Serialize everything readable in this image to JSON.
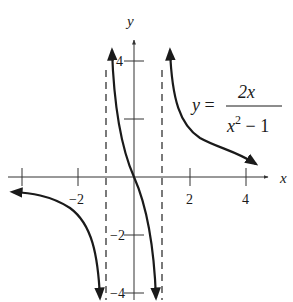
{
  "figure": {
    "type": "function-graph",
    "function": "y = 2x / (x^2 - 1)",
    "equation": {
      "lhs": "y =",
      "numerator": "2x",
      "denominator_base": "x",
      "denominator_exp": "2",
      "denominator_rest": " − 1"
    },
    "axes": {
      "x_label": "x",
      "y_label": "y",
      "x_ticks": [
        {
          "value": -4,
          "label": ""
        },
        {
          "value": -2,
          "label": "−2"
        },
        {
          "value": 2,
          "label": "2"
        },
        {
          "value": 4,
          "label": "4"
        }
      ],
      "y_ticks": [
        {
          "value": 4,
          "label": "4"
        },
        {
          "value": 2,
          "label": ""
        },
        {
          "value": -2,
          "label": "−2"
        },
        {
          "value": -4,
          "label": "−4"
        }
      ]
    },
    "asymptotes": [
      {
        "type": "vertical",
        "x": -1,
        "style": "dashed"
      },
      {
        "type": "vertical",
        "x": 1,
        "style": "dashed"
      },
      {
        "type": "horizontal",
        "y": 0
      }
    ],
    "colors": {
      "curve": "#1a1a1a",
      "axes": "#333333",
      "asymptote": "#333333"
    }
  }
}
